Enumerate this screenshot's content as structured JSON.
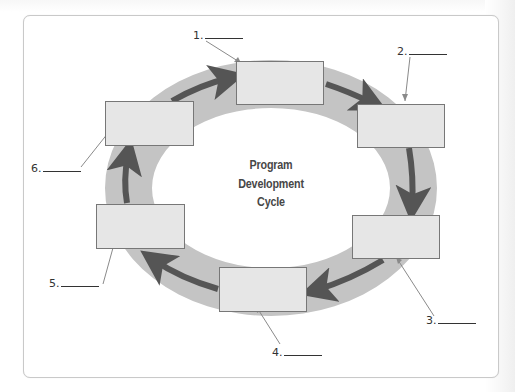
{
  "diagram": {
    "title_lines": [
      "Program",
      "Development",
      "Cycle"
    ],
    "stages": [
      {
        "number": "1.",
        "blank": ""
      },
      {
        "number": "2.",
        "blank": ""
      },
      {
        "number": "3.",
        "blank": ""
      },
      {
        "number": "4.",
        "blank": ""
      },
      {
        "number": "5.",
        "blank": ""
      },
      {
        "number": "6.",
        "blank": ""
      }
    ],
    "flow_direction": "clockwise",
    "colors": {
      "ring": "#c4c4c4",
      "arrow": "#555555",
      "box_fill": "#e6e6e6",
      "box_border": "#777777",
      "leader_line": "#8a8a8a",
      "text": "#333333"
    }
  }
}
